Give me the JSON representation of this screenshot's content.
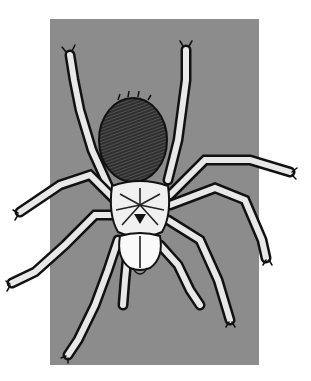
{
  "image": {
    "subject": "spider illustration",
    "description": "Pen-and-ink style drawing of a hairy tarantula-like spider viewed from above, on a gray rectangular background",
    "colors": {
      "page_background": "#ffffff",
      "panel_background": "#8c8c8c",
      "ink": "#111111",
      "highlight": "#f2f2f2",
      "abdomen": "#3a3a3a"
    }
  }
}
